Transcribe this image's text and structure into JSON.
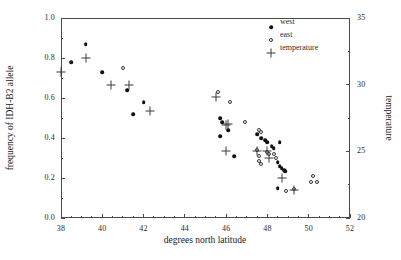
{
  "chart_data": {
    "type": "scatter",
    "title": "",
    "xlabel": "degrees north latitude",
    "ylabel": "frequency of IDH-B2 allele",
    "y2label": "temperature",
    "xlim": [
      38,
      52
    ],
    "ylim": [
      0.0,
      1.0
    ],
    "y2lim": [
      20,
      35
    ],
    "xticks": [
      38,
      40,
      42,
      44,
      46,
      48,
      50,
      52
    ],
    "xticklabels": [
      "38",
      "40",
      "42",
      "44",
      "46",
      "48",
      "50",
      "52"
    ],
    "yticks": [
      0.0,
      0.2,
      0.4,
      0.6,
      0.8,
      1.0
    ],
    "yticklabels": [
      "0.0",
      "0.2",
      "0.4",
      "0.6",
      "0.8",
      "1.0"
    ],
    "y2ticks": [
      20,
      25,
      30,
      35
    ],
    "y2ticklabels": [
      "20",
      "25",
      "30",
      "35"
    ],
    "grid": false,
    "legend_position": "upper right",
    "legend": [
      {
        "name": "west",
        "marker": "filled-circle"
      },
      {
        "name": "east",
        "marker": "open-circle"
      },
      {
        "name": "temperature",
        "marker": "plus"
      }
    ],
    "series": [
      {
        "name": "west",
        "marker": "filled-circle",
        "axis": "left",
        "points": [
          [
            38.5,
            0.78
          ],
          [
            39.2,
            0.87
          ],
          [
            40.0,
            0.73
          ],
          [
            41.2,
            0.64
          ],
          [
            41.5,
            0.52
          ],
          [
            42.0,
            0.58
          ],
          [
            45.7,
            0.5
          ],
          [
            45.8,
            0.48
          ],
          [
            45.7,
            0.41
          ],
          [
            46.1,
            0.44
          ],
          [
            46.4,
            0.31
          ],
          [
            47.5,
            0.42
          ],
          [
            47.7,
            0.4
          ],
          [
            47.9,
            0.39
          ],
          [
            48.0,
            0.38
          ],
          [
            48.2,
            0.36
          ],
          [
            48.3,
            0.35
          ],
          [
            48.6,
            0.38
          ],
          [
            48.5,
            0.28
          ],
          [
            48.6,
            0.26
          ],
          [
            48.7,
            0.25
          ],
          [
            48.8,
            0.24
          ],
          [
            48.85,
            0.235
          ],
          [
            48.5,
            0.15
          ]
        ]
      },
      {
        "name": "east",
        "marker": "open-circle",
        "axis": "left",
        "points": [
          [
            41.0,
            0.75
          ],
          [
            45.6,
            0.63
          ],
          [
            46.2,
            0.58
          ],
          [
            46.9,
            0.48
          ],
          [
            47.6,
            0.44
          ],
          [
            47.7,
            0.43
          ],
          [
            47.5,
            0.34
          ],
          [
            47.6,
            0.31
          ],
          [
            47.6,
            0.285
          ],
          [
            47.7,
            0.27
          ],
          [
            48.0,
            0.33
          ],
          [
            48.1,
            0.32
          ],
          [
            48.3,
            0.32
          ],
          [
            48.4,
            0.3
          ],
          [
            48.9,
            0.135
          ],
          [
            49.3,
            0.145
          ],
          [
            50.2,
            0.21
          ],
          [
            50.1,
            0.18
          ],
          [
            50.4,
            0.18
          ]
        ]
      },
      {
        "name": "temperature",
        "marker": "plus",
        "axis": "right",
        "points": [
          [
            38.0,
            30.95
          ],
          [
            39.2,
            32.0
          ],
          [
            40.4,
            29.95
          ],
          [
            41.3,
            30.0
          ],
          [
            42.3,
            28.0
          ],
          [
            45.5,
            29.05
          ],
          [
            46.0,
            27.0
          ],
          [
            46.1,
            27.05
          ],
          [
            46.0,
            25.0
          ],
          [
            47.5,
            25.0
          ],
          [
            48.0,
            25.0
          ],
          [
            48.1,
            24.5
          ],
          [
            48.7,
            23.0
          ],
          [
            49.3,
            22.1
          ]
        ]
      }
    ]
  }
}
